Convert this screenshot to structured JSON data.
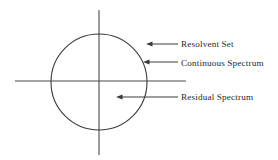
{
  "figure": {
    "kind": "spectrum-region-diagram",
    "background_color": "#ffffff",
    "stroke_color": "#3a3a3a",
    "text_color": "#2a2a2a"
  },
  "axes": {
    "horizontal": {
      "name": "real-axis",
      "x1": 15,
      "y1": 81,
      "x2": 186,
      "y2": 81
    },
    "vertical": {
      "name": "imaginary-axis",
      "x1": 99,
      "y1": 10,
      "x2": 99,
      "y2": 155
    }
  },
  "circle": {
    "name": "spectrum-circle",
    "cx": 99,
    "cy": 82,
    "r": 48
  },
  "annotations": [
    {
      "id": "resolvent-set",
      "label": "Resolvent Set",
      "arrow": {
        "tip_x": 146,
        "tip_y": 44,
        "tail_x": 178,
        "tail_y": 44
      },
      "target_region": "outside-circle"
    },
    {
      "id": "continuous-spectrum",
      "label": "Continuous Spectrum",
      "arrow": {
        "tip_x": 143,
        "tip_y": 62,
        "tail_x": 178,
        "tail_y": 62
      },
      "target_region": "circle-boundary"
    },
    {
      "id": "residual-spectrum",
      "label": "Residual Spectrum",
      "arrow": {
        "tip_x": 116,
        "tip_y": 97,
        "tail_x": 178,
        "tail_y": 97
      },
      "target_region": "inside-circle"
    }
  ]
}
